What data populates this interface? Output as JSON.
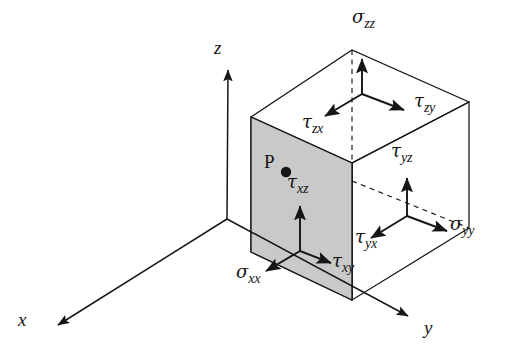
{
  "figure": {
    "type": "stress-tensor-diagram",
    "background_color": "#ffffff",
    "line_color": "#151515",
    "face_fill_color": "#c9c9c9"
  },
  "axes": [
    {
      "name": "x-axis",
      "label": "x",
      "label_x": 18,
      "label_y": 310
    },
    {
      "name": "z-axis",
      "label": "z",
      "label_x": 214,
      "label_y": 38
    },
    {
      "name": "y-axis",
      "label": "y",
      "label_x": 424,
      "label_y": 318
    }
  ],
  "point": {
    "name": "point-P",
    "label": "P",
    "label_x": 264,
    "label_y": 152,
    "dot_x": 286,
    "dot_y": 172,
    "dot_radius": 5
  },
  "stress_labels": [
    {
      "name": "sigma-zz",
      "symbol": "σ",
      "subscript": "zz",
      "x": 352,
      "y": 8,
      "desc": "normal stress on top z-face"
    },
    {
      "name": "tau-zy",
      "symbol": "τ",
      "subscript": "zy",
      "x": 414,
      "y": 92,
      "desc": "shear on z-face toward y"
    },
    {
      "name": "tau-zx",
      "symbol": "τ",
      "subscript": "zx",
      "x": 302,
      "y": 113,
      "desc": "shear on z-face toward x"
    },
    {
      "name": "tau-yz",
      "symbol": "τ",
      "subscript": "yz",
      "x": 391,
      "y": 142,
      "desc": "shear on y-face toward z"
    },
    {
      "name": "sigma-yy",
      "symbol": "σ",
      "subscript": "yy",
      "x": 450,
      "y": 215,
      "desc": "normal stress on right y-face"
    },
    {
      "name": "tau-yx",
      "symbol": "τ",
      "subscript": "yx",
      "x": 355,
      "y": 228,
      "desc": "shear on y-face toward x"
    },
    {
      "name": "tau-xz",
      "symbol": "τ",
      "subscript": "xz",
      "x": 287,
      "y": 173,
      "desc": "shear on x-face toward z"
    },
    {
      "name": "tau-xy",
      "symbol": "τ",
      "subscript": "xy",
      "x": 332,
      "y": 252,
      "desc": "shear on x-face toward y"
    },
    {
      "name": "sigma-xx",
      "symbol": "σ",
      "subscript": "xx",
      "x": 236,
      "y": 263,
      "desc": "normal stress on front x-face"
    }
  ],
  "geometry": {
    "origin": {
      "x": 227,
      "y": 219
    },
    "x_axis_tip": {
      "x": 55,
      "y": 327
    },
    "z_axis_tip": {
      "x": 228,
      "y": 66
    },
    "y_axis_tip": {
      "x": 411,
      "y": 318
    },
    "cube": {
      "front_top_left": {
        "x": 251,
        "y": 117
      },
      "front_top_right": {
        "x": 352,
        "y": 163
      },
      "front_bottom_right": {
        "x": 352,
        "y": 300
      },
      "front_bottom_left": {
        "x": 251,
        "y": 252
      },
      "back_top_left": {
        "x": 352,
        "y": 50
      },
      "back_top_right": {
        "x": 469,
        "y": 102
      },
      "back_bottom_right": {
        "x": 469,
        "y": 228
      },
      "back_bottom_left": {
        "x": 352,
        "y": 181
      }
    },
    "arrow_origins": {
      "top_face": {
        "x": 362,
        "y": 94
      },
      "front_face": {
        "x": 300,
        "y": 251
      },
      "right_face": {
        "x": 407,
        "y": 216
      }
    }
  }
}
